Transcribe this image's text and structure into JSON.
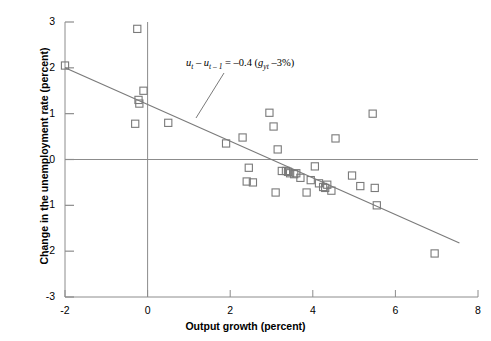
{
  "chart_data": {
    "type": "scatter",
    "title": "",
    "xlabel": "Output growth (percent)",
    "ylabel": "Change in the unemployment rate (percent)",
    "xlim": [
      -2,
      8
    ],
    "ylim": [
      -3,
      3
    ],
    "xticks": [
      -2,
      0,
      2,
      4,
      6,
      8
    ],
    "yticks": [
      3,
      2,
      1,
      0,
      -1,
      -2,
      -3
    ],
    "xtick_labels": [
      "-2",
      "0",
      "2",
      "4",
      "6",
      "8"
    ],
    "ytick_labels": [
      "3",
      "2",
      "1",
      "0",
      "-1",
      "-2",
      "-3"
    ],
    "grid": false,
    "legend": "none",
    "zero_lines": {
      "vertical_x": 0,
      "horizontal_y": 0
    },
    "marker": "open-square",
    "marker_color": "#7a7a7a",
    "line_color": "#7a7a7a",
    "axis_color": "#8c8c8c",
    "points": [
      {
        "x": -2.0,
        "y": 2.05
      },
      {
        "x": -0.3,
        "y": 0.78
      },
      {
        "x": -0.25,
        "y": 2.85
      },
      {
        "x": -0.22,
        "y": 1.3
      },
      {
        "x": -0.2,
        "y": 1.22
      },
      {
        "x": -0.1,
        "y": 1.5
      },
      {
        "x": 0.5,
        "y": 0.8
      },
      {
        "x": 1.9,
        "y": 0.35
      },
      {
        "x": 2.3,
        "y": 0.48
      },
      {
        "x": 2.4,
        "y": -0.48
      },
      {
        "x": 2.55,
        "y": -0.5
      },
      {
        "x": 2.45,
        "y": -0.18
      },
      {
        "x": 2.95,
        "y": 1.02
      },
      {
        "x": 3.05,
        "y": 0.72
      },
      {
        "x": 3.1,
        "y": -0.72
      },
      {
        "x": 3.15,
        "y": 0.22
      },
      {
        "x": 3.25,
        "y": -0.25
      },
      {
        "x": 3.35,
        "y": -0.25
      },
      {
        "x": 3.4,
        "y": -0.27
      },
      {
        "x": 3.45,
        "y": -0.3
      },
      {
        "x": 3.55,
        "y": -0.32
      },
      {
        "x": 3.6,
        "y": -0.3
      },
      {
        "x": 3.7,
        "y": -0.4
      },
      {
        "x": 3.85,
        "y": -0.72
      },
      {
        "x": 3.95,
        "y": -0.45
      },
      {
        "x": 4.05,
        "y": -0.15
      },
      {
        "x": 4.15,
        "y": -0.52
      },
      {
        "x": 4.25,
        "y": -0.6
      },
      {
        "x": 4.3,
        "y": -0.62
      },
      {
        "x": 4.35,
        "y": -0.55
      },
      {
        "x": 4.45,
        "y": -0.68
      },
      {
        "x": 4.55,
        "y": 0.46
      },
      {
        "x": 4.95,
        "y": -0.35
      },
      {
        "x": 5.15,
        "y": -0.58
      },
      {
        "x": 5.45,
        "y": 1.0
      },
      {
        "x": 5.5,
        "y": -0.62
      },
      {
        "x": 5.55,
        "y": -1.0
      },
      {
        "x": 6.95,
        "y": -2.05
      }
    ],
    "fit_line": {
      "equation": "u_t - u_{t-1} = -0.4 (g_yt - 3%)",
      "slope": -0.4,
      "intercept": 1.2,
      "x_start": -2.0,
      "x_end": 7.55,
      "y_start": 2.0,
      "y_end": -1.82
    },
    "annotation": {
      "lhs_u": "u",
      "lhs_sub1": "t",
      "minus": " – ",
      "lhs_u2": "u",
      "lhs_sub2": "t – 1",
      "equals": " = –0.4 (",
      "g": "g",
      "g_sub": "yt",
      "tail": " –3%)",
      "full_text": "ut – ut – 1 = –0.4 (gyt –3%)"
    }
  }
}
